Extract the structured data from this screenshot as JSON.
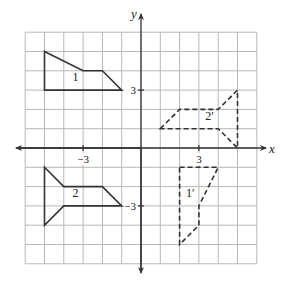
{
  "diagram": {
    "type": "coordinate-plane-transformations",
    "axes": {
      "x_label": "x",
      "y_label": "y",
      "range": [
        -6,
        6
      ],
      "ticks": [
        {
          "axis": "x",
          "value": -3,
          "label": "−3"
        },
        {
          "axis": "x",
          "value": 3,
          "label": "3"
        },
        {
          "axis": "y",
          "value": 3,
          "label": "3"
        },
        {
          "axis": "y",
          "value": -3,
          "label": "−3"
        }
      ]
    },
    "figures": [
      {
        "label": "1",
        "style": "solid",
        "vertices": [
          [
            -5,
            5
          ],
          [
            -3,
            4
          ],
          [
            -2,
            4
          ],
          [
            -1,
            3
          ],
          [
            -5,
            3
          ]
        ],
        "label_pos": [
          -3.4,
          3.45
        ]
      },
      {
        "label": "2",
        "style": "solid",
        "vertices": [
          [
            -5,
            -1
          ],
          [
            -4,
            -2
          ],
          [
            -2,
            -2
          ],
          [
            -1,
            -3
          ],
          [
            -4,
            -3
          ],
          [
            -5,
            -4
          ]
        ],
        "label_pos": [
          -3.4,
          -2.55
        ]
      },
      {
        "label": "1′",
        "style": "dashed",
        "vertices": [
          [
            2,
            -1
          ],
          [
            4,
            -1
          ],
          [
            3,
            -3
          ],
          [
            3,
            -4
          ],
          [
            2,
            -5
          ]
        ],
        "label_pos": [
          2.55,
          -2.55
        ]
      },
      {
        "label": "2′",
        "style": "dashed",
        "vertices": [
          [
            1,
            1
          ],
          [
            2,
            2
          ],
          [
            4,
            2
          ],
          [
            5,
            3
          ],
          [
            5,
            0
          ],
          [
            4,
            1
          ]
        ],
        "label_pos": [
          3.55,
          1.45
        ]
      }
    ],
    "colors": {
      "grid": "#b8b8b8",
      "axis": "#333333",
      "figure": "#333333"
    }
  }
}
